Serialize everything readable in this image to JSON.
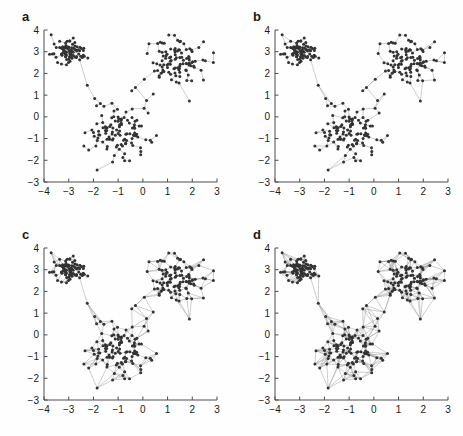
{
  "figure": {
    "type": "multi-panel-network-scatter",
    "panel_count": 4,
    "layout": "2x2",
    "background_color": "#fefefe",
    "node_color": "#333333",
    "edge_color": "#9a9a9a",
    "axis_color": "#4d4d4d",
    "tick_label_color": "#1a1a1a"
  },
  "panels": [
    {
      "label": "a",
      "name": "panel-a",
      "edge_mode": "minimum-spanning-tree",
      "neighbors_k": 1,
      "edge_count_approx": 299,
      "description": "Sparse tree connecting all nodes with single paths"
    },
    {
      "label": "b",
      "name": "panel-b",
      "edge_mode": "k-nearest-neighbors",
      "neighbors_k": 2,
      "edge_count_approx": 520,
      "description": "Moderately connected graph with local loops"
    },
    {
      "label": "c",
      "name": "panel-c",
      "edge_mode": "k-nearest-neighbors",
      "neighbors_k": 4,
      "edge_count_approx": 980,
      "description": "Dense triangulated network within clusters"
    },
    {
      "label": "d",
      "name": "panel-d",
      "edge_mode": "k-nearest-neighbors",
      "neighbors_k": 6,
      "edge_count_approx": 1400,
      "description": "Densest network with long-range inter-cluster links"
    }
  ],
  "chart_data": {
    "type": "scatter",
    "title": "",
    "xlabel": "",
    "ylabel": "",
    "xlim": [
      -4,
      3
    ],
    "ylim": [
      -3,
      4
    ],
    "xticks": [
      -4,
      -3,
      -2,
      -1,
      0,
      1,
      2,
      3
    ],
    "yticks": [
      -3,
      -2,
      -1,
      0,
      1,
      2,
      3,
      4
    ],
    "xtick_labels": [
      "-4",
      "-3",
      "-2",
      "-1",
      "0",
      "1",
      "2",
      "3"
    ],
    "ytick_labels": [
      "-3",
      "-2",
      "-1",
      "0",
      "1",
      "2",
      "3",
      "4"
    ],
    "grid": false,
    "legend": false,
    "n_points": 300,
    "marker_size": 3.0,
    "clusters": [
      {
        "name": "upper-left",
        "center_x": -3.0,
        "center_y": 3.0,
        "spread_x": 0.32,
        "spread_y": 0.26,
        "n_points": 85
      },
      {
        "name": "upper-right",
        "center_x": 1.45,
        "center_y": 2.45,
        "spread_x": 0.55,
        "spread_y": 0.55,
        "n_points": 105
      },
      {
        "name": "lower-center",
        "center_x": -0.85,
        "center_y": -0.6,
        "spread_x": 0.62,
        "spread_y": 0.62,
        "n_points": 110
      }
    ],
    "bridge_points": [
      {
        "x": -2.25,
        "y": 1.45
      },
      {
        "x": -1.95,
        "y": 0.85
      },
      {
        "x": -1.72,
        "y": 0.62
      },
      {
        "x": 0.15,
        "y": 0.75
      },
      {
        "x": 0.42,
        "y": 1.05
      },
      {
        "x": -0.3,
        "y": 1.35
      },
      {
        "x": -0.45,
        "y": 1.2
      },
      {
        "x": 0.05,
        "y": 0.4
      },
      {
        "x": -1.85,
        "y": -2.45
      },
      {
        "x": 2.45,
        "y": 1.7
      }
    ]
  }
}
